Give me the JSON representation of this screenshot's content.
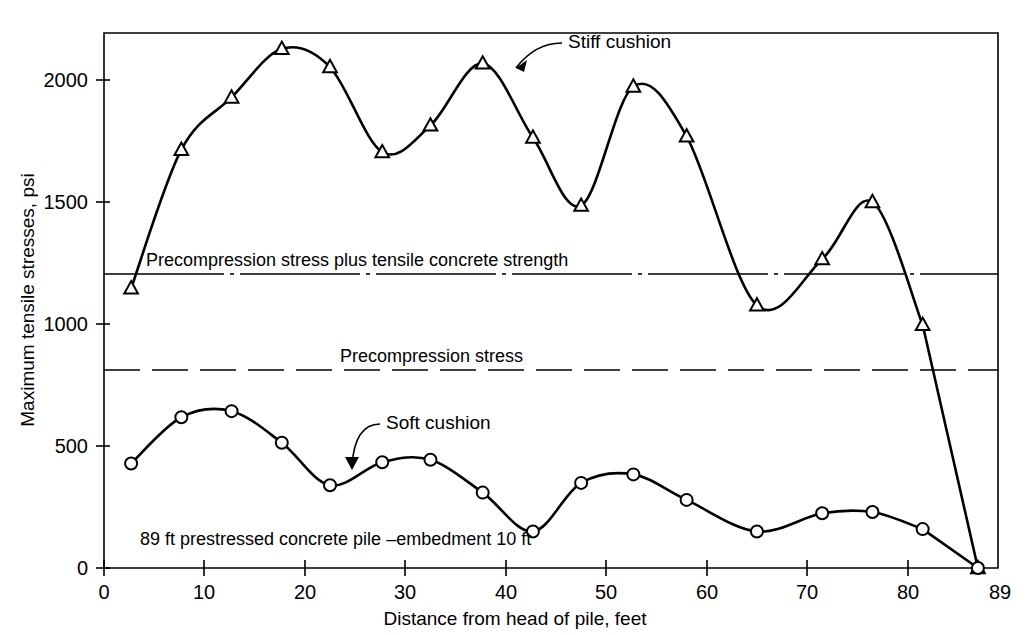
{
  "chart_data": {
    "type": "line",
    "title": "",
    "xlabel": "Distance from head of pile, feet",
    "ylabel": "Maximum tensile stresses, psi",
    "xlim": [
      0,
      89
    ],
    "ylim": [
      0,
      2200
    ],
    "grid": false,
    "legend_position": "inline-annotation",
    "xticks": [
      0,
      10,
      20,
      30,
      40,
      50,
      60,
      70,
      80,
      89
    ],
    "xtick_labels": [
      "0",
      "10",
      "20",
      "30",
      "40",
      "50",
      "60",
      "70",
      "80",
      "89"
    ],
    "yticks": [
      0,
      500,
      1000,
      1500,
      2000
    ],
    "ytick_labels": [
      "0",
      "500",
      "1000",
      "1500",
      "2000"
    ],
    "series": [
      {
        "name": "Stiff cushion",
        "marker": "triangle-up-open",
        "x": [
          2.7,
          7.7,
          12.7,
          17.7,
          22.5,
          27.7,
          32.5,
          37.7,
          42.7,
          47.5,
          52.7,
          58.0,
          65.0,
          71.5,
          76.5,
          81.5,
          87.0
        ],
        "values": [
          1150,
          1720,
          1935,
          2135,
          2060,
          1710,
          1820,
          2075,
          1770,
          1490,
          1980,
          1775,
          1080,
          1270,
          1505,
          1000,
          0
        ]
      },
      {
        "name": "Soft cushion",
        "marker": "circle-open",
        "x": [
          2.7,
          7.7,
          12.7,
          17.7,
          22.5,
          27.7,
          32.5,
          37.7,
          42.7,
          47.5,
          52.7,
          58.0,
          65.0,
          71.5,
          76.5,
          81.5,
          87.0
        ],
        "values": [
          430,
          620,
          645,
          515,
          340,
          435,
          445,
          310,
          150,
          350,
          385,
          280,
          150,
          225,
          230,
          160,
          0
        ]
      }
    ],
    "reference_lines": [
      {
        "label": "Precompression stress plus tensile concrete strength",
        "value": 1205,
        "style": "dash-dot"
      },
      {
        "label": "Precompression stress",
        "value": 810,
        "style": "dashed"
      }
    ],
    "annotations": [
      {
        "name": "stiff-cushion-label",
        "text": "Stiff cushion"
      },
      {
        "name": "soft-cushion-label",
        "text": "Soft cushion"
      },
      {
        "name": "pile-note",
        "text": "89 ft prestressed concrete pile –embedment 10 ft"
      }
    ]
  },
  "colors": {
    "ink": "#000000",
    "paper": "#ffffff",
    "marker_fill": "#ffffff"
  }
}
